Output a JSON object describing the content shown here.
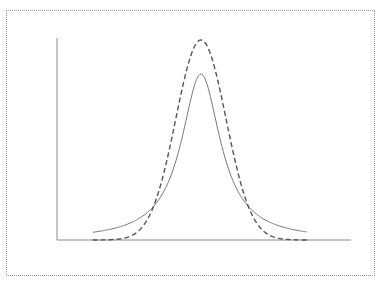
{
  "chart_data": {
    "type": "line",
    "title": "",
    "xlabel": "",
    "ylabel": "",
    "xlim": [
      -5.85,
      6.1
    ],
    "ylim": [
      0,
      1.01
    ],
    "grid": false,
    "legend": "none",
    "x_ticks": [],
    "y_ticks": [],
    "series": [
      {
        "name": "solid-curve",
        "style": "solid",
        "color": "#777777",
        "function": "lorentzian",
        "center": 0,
        "peak": 0.83,
        "gamma": 0.97,
        "x_range": [
          -4.4,
          4.3
        ],
        "x": [
          -4.4,
          -4,
          -3,
          -2,
          -1.5,
          -1,
          -0.5,
          0,
          0.5,
          1,
          1.5,
          2,
          3,
          4,
          4.3
        ],
        "values": [
          0.038,
          0.047,
          0.079,
          0.158,
          0.245,
          0.4,
          0.65,
          0.83,
          0.65,
          0.4,
          0.245,
          0.158,
          0.079,
          0.047,
          0.041
        ]
      },
      {
        "name": "dashed-curve",
        "style": "dashed",
        "color": "#555555",
        "function": "gaussian",
        "center": 0,
        "peak": 1.0,
        "sigma": 1.02,
        "x_range": [
          -4.4,
          4.3
        ],
        "x": [
          -4.4,
          -4,
          -3,
          -2,
          -1.5,
          -1,
          -0.5,
          0,
          0.5,
          1,
          1.5,
          2,
          3,
          4,
          4.3
        ],
        "values": [
          0.0001,
          0.0005,
          0.013,
          0.146,
          0.339,
          0.618,
          0.887,
          1.0,
          0.887,
          0.618,
          0.339,
          0.146,
          0.013,
          0.0005,
          0.0001
        ]
      }
    ]
  },
  "colors": {
    "axis": "#8a8a8a",
    "frame": "#9a9a9a"
  }
}
